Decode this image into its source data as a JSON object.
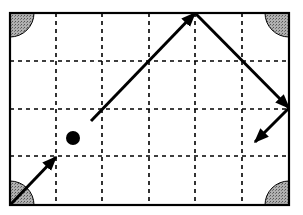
{
  "diagram": {
    "title": "",
    "type": "billiard-table-path",
    "table": {
      "x": 10,
      "y": 13,
      "width": 279,
      "height": 192,
      "columns": 6,
      "rows": 4
    },
    "grid_x": [
      56,
      102,
      149,
      195,
      242
    ],
    "grid_y": [
      61,
      109,
      156
    ],
    "pockets": [
      {
        "name": "top-left",
        "cx": 10,
        "cy": 13
      },
      {
        "name": "top-right",
        "cx": 289,
        "cy": 13
      },
      {
        "name": "bottom-left",
        "cx": 10,
        "cy": 205
      },
      {
        "name": "bottom-right",
        "cx": 289,
        "cy": 205
      }
    ],
    "ball": {
      "cx": 73,
      "cy": 138,
      "r": 7
    },
    "arrows": [
      {
        "x1": 10,
        "y1": 205,
        "x2": 56,
        "y2": 157
      },
      {
        "x1": 91,
        "y1": 121,
        "x2": 195,
        "y2": 13
      },
      {
        "x1": 195,
        "y1": 13,
        "x2": 289,
        "y2": 108
      },
      {
        "x1": 289,
        "y1": 108,
        "x2": 255,
        "y2": 142
      }
    ],
    "colors": {
      "line": "#000000",
      "pocket": "#9a9a9a",
      "background": "#ffffff"
    }
  }
}
